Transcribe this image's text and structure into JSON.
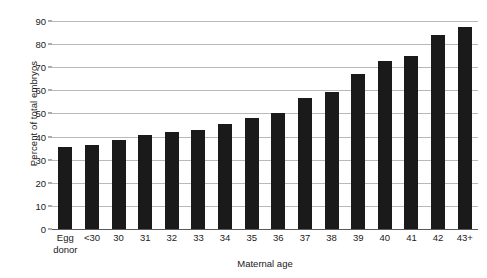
{
  "chart_data": {
    "type": "bar",
    "title": "",
    "xlabel": "Maternal age",
    "ylabel": "Percent of total embryos",
    "categories": [
      "Egg donor",
      "<30",
      "30",
      "31",
      "32",
      "33",
      "34",
      "35",
      "36",
      "37",
      "38",
      "39",
      "40",
      "41",
      "42",
      "43+"
    ],
    "category_lines": [
      [
        "Egg",
        "donor"
      ],
      [
        "<30",
        ""
      ],
      [
        "30",
        ""
      ],
      [
        "31",
        ""
      ],
      [
        "32",
        ""
      ],
      [
        "33",
        ""
      ],
      [
        "34",
        ""
      ],
      [
        "35",
        ""
      ],
      [
        "36",
        ""
      ],
      [
        "37",
        ""
      ],
      [
        "38",
        ""
      ],
      [
        "39",
        ""
      ],
      [
        "40",
        ""
      ],
      [
        "41",
        ""
      ],
      [
        "42",
        ""
      ],
      [
        "43+",
        ""
      ]
    ],
    "values": [
      35.5,
      36.5,
      38.5,
      40.5,
      42,
      43,
      45.5,
      48,
      50,
      56.5,
      59.5,
      67,
      72.5,
      75,
      84,
      87.5
    ],
    "ylim": [
      0,
      90
    ],
    "ytick_step": 10,
    "yticks": [
      0,
      10,
      20,
      30,
      40,
      50,
      60,
      70,
      80,
      90
    ],
    "ytick_labels": [
      "0",
      "10",
      "20",
      "30",
      "40",
      "50",
      "60",
      "70",
      "80",
      "90"
    ],
    "grid": true,
    "legend": "none",
    "bar_color": "#1a1a1a",
    "gridline_color": "#b9b9b9",
    "axis_color": "#5a5a5a",
    "background_color": "#ffffff"
  }
}
